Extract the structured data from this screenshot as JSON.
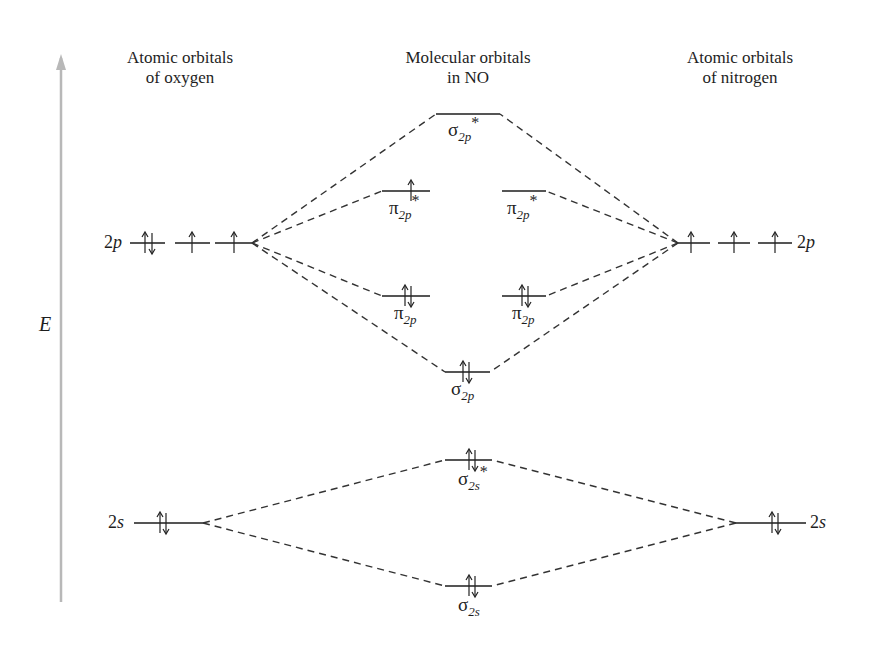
{
  "headers": {
    "left": {
      "line1": "Atomic orbitals",
      "line2": "of oxygen"
    },
    "center": {
      "line1": "Molecular orbitals",
      "line2": "in NO"
    },
    "right": {
      "line1": "Atomic orbitals",
      "line2": "of nitrogen"
    }
  },
  "axis": {
    "label": "E",
    "color": "#b8b8b8"
  },
  "colors": {
    "line": "#555555",
    "dash": "#333333",
    "text": "#1e1e1e"
  },
  "atomic_orbitals": {
    "oxygen": {
      "2p": {
        "label_num": "2",
        "label_letter": "p",
        "electrons": [
          "↑↓",
          "↑",
          "↑"
        ]
      },
      "2s": {
        "label_num": "2",
        "label_letter": "s",
        "electrons": [
          "↑↓"
        ]
      }
    },
    "nitrogen": {
      "2p": {
        "label_num": "2",
        "label_letter": "p",
        "electrons": [
          "↑",
          "↑",
          "↑"
        ]
      },
      "2s": {
        "label_num": "2",
        "label_letter": "s",
        "electrons": [
          "↑↓"
        ]
      }
    }
  },
  "molecular_orbitals": [
    {
      "id": "sigma2p_star",
      "symbol": "σ",
      "sub": "2p",
      "star": "*",
      "electrons": ""
    },
    {
      "id": "pi2p_star_a",
      "symbol": "π",
      "sub": "2p",
      "star": "*",
      "electrons": "↑"
    },
    {
      "id": "pi2p_star_b",
      "symbol": "π",
      "sub": "2p",
      "star": "*",
      "electrons": ""
    },
    {
      "id": "pi2p_a",
      "symbol": "π",
      "sub": "2p",
      "star": "",
      "electrons": "↑↓"
    },
    {
      "id": "pi2p_b",
      "symbol": "π",
      "sub": "2p",
      "star": "",
      "electrons": "↑↓"
    },
    {
      "id": "sigma2p",
      "symbol": "σ",
      "sub": "2p",
      "star": "",
      "electrons": "↑↓"
    },
    {
      "id": "sigma2s_star",
      "symbol": "σ",
      "sub": "2s",
      "star": "*",
      "electrons": "↑↓"
    },
    {
      "id": "sigma2s",
      "symbol": "σ",
      "sub": "2s",
      "star": "",
      "electrons": "↑↓"
    }
  ]
}
